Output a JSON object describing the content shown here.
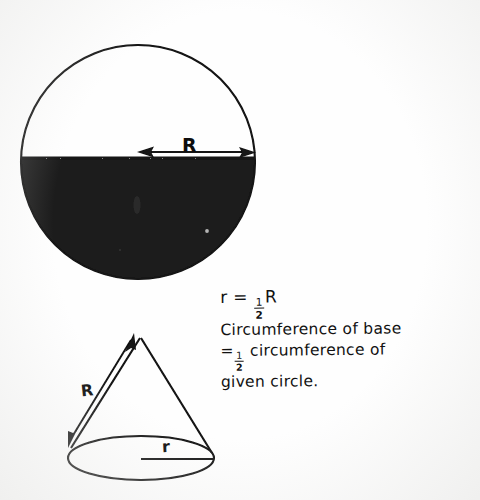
{
  "document": {
    "kind": "hand-drawn geometry diagram",
    "background_color": "#fefefe",
    "ink_color": "#111111",
    "fill_color": "#1a1a1a"
  },
  "figures": {
    "circle": {
      "name": "given-circle",
      "description": "Circle with lower half shaded solid black and a horizontal radius arrow labeled R",
      "center_x": 138,
      "center_y": 162,
      "radius": 117,
      "shaded_half": "bottom",
      "radius_arrow": {
        "label": "R",
        "from_x": 138,
        "to_x": 254,
        "y": 152,
        "double_headed": true
      }
    },
    "cone": {
      "name": "constructed-cone",
      "description": "Cone formed from the half circle, slant height R, base radius r",
      "apex_x": 140,
      "apex_y": 337,
      "base_center_x": 141,
      "base_center_y": 458,
      "base_rx": 73,
      "base_ry": 22,
      "slant_arrow": {
        "label": "R",
        "double_headed": true
      },
      "base_radius_line": {
        "label": "r"
      }
    }
  },
  "labels": {
    "circle_radius": "R",
    "cone_slant": "R",
    "cone_base_radius": "r"
  },
  "annotation": {
    "line1_prefix": "r = ",
    "line1_num": "1",
    "line1_den": "2",
    "line1_suffix": "R",
    "line2": "Circumference of base",
    "line3_prefix": "=",
    "line3_num": "1",
    "line3_den": "2",
    "line3_suffix": " circumference of",
    "line4": "given circle."
  }
}
